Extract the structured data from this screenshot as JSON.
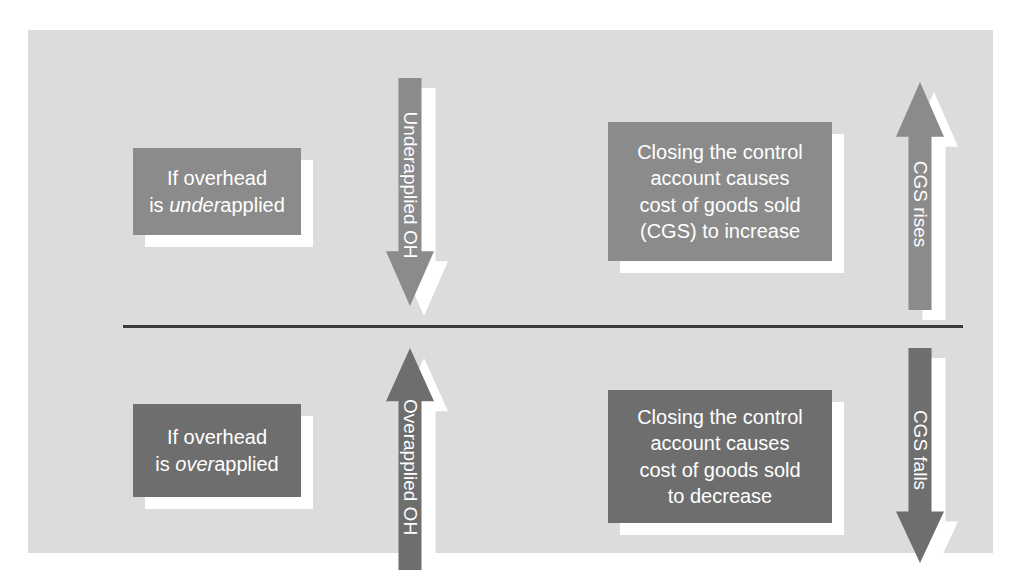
{
  "diagram": {
    "colors": {
      "panel_background": "#dcdcdc",
      "box_light_gray": "#8b8b8b",
      "box_dark_gray": "#6e6e6e",
      "shadow": "#ffffff",
      "divider": "#3a3a3a",
      "text": "#ffffff"
    },
    "rows": [
      {
        "id": "underapplied-row",
        "condition_box": {
          "line1": "If overhead",
          "line2_prefix": "is ",
          "line2_emphasis": "under",
          "line2_suffix": "applied"
        },
        "arrow": {
          "label": "Underapplied OH",
          "direction": "down"
        },
        "result_box": {
          "line1": "Closing the control",
          "line2": "account causes",
          "line3": "cost of goods sold",
          "line4": "(CGS) to increase"
        },
        "outcome_arrow": {
          "label": "CGS rises",
          "direction": "up"
        }
      },
      {
        "id": "overapplied-row",
        "condition_box": {
          "line1": "If overhead",
          "line2_prefix": "is ",
          "line2_emphasis": "over",
          "line2_suffix": "applied"
        },
        "arrow": {
          "label": "Overapplied OH",
          "direction": "up"
        },
        "result_box": {
          "line1": "Closing the control",
          "line2": "account causes",
          "line3": "cost of goods sold",
          "line4": "to decrease"
        },
        "outcome_arrow": {
          "label": "CGS falls",
          "direction": "down"
        }
      }
    ]
  }
}
